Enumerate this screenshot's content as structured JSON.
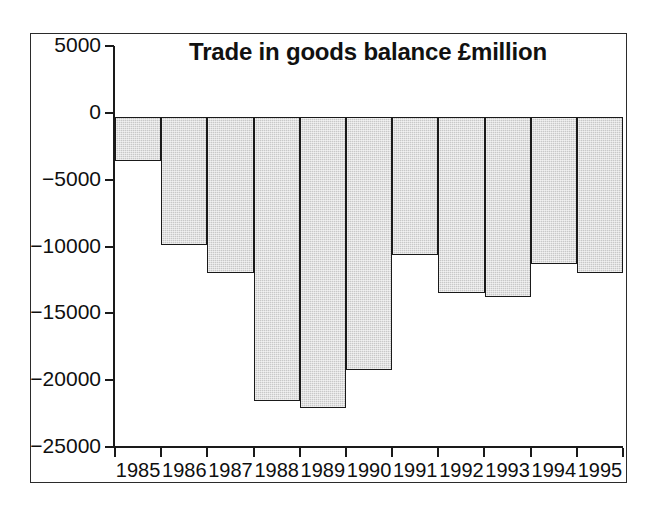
{
  "chart_data": {
    "type": "bar",
    "title": "Trade in goods balance £million",
    "xlabel": "",
    "ylabel": "",
    "categories": [
      "1985",
      "1986",
      "1987",
      "1988",
      "1989",
      "1990",
      "1991",
      "1992",
      "1993",
      "1994",
      "1995"
    ],
    "values": [
      -3300,
      -9650,
      -11800,
      -21500,
      -22000,
      -19150,
      -10400,
      -13300,
      -13600,
      -11100,
      -11800
    ],
    "series": [
      {
        "name": "Trade in goods balance",
        "values": [
          -3300,
          -9650,
          -11800,
          -21500,
          -22000,
          -19150,
          -10400,
          -13300,
          -13600,
          -11100,
          -11800
        ]
      }
    ],
    "ylim": [
      -25000,
      5000
    ],
    "yticks": [
      5000,
      0,
      -5000,
      -10000,
      -15000,
      -20000,
      -25000
    ],
    "ytick_labels": [
      "5000",
      "0",
      "−5000",
      "−10000",
      "−15000",
      "−20000",
      "−25000"
    ],
    "grid": false,
    "legend": false,
    "legend_position": "none",
    "bar_fill_color": "#c8c8c8",
    "bar_edge_color": "#1a1a1a",
    "axis_color": "#1a1a1a",
    "background_color": "#ffffff",
    "units": "£million",
    "zero_baseline": 0
  },
  "figure": {
    "title": "Trade in goods balance £million"
  }
}
